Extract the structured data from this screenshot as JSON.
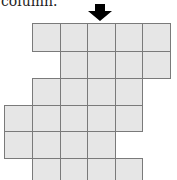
{
  "caption": {
    "text": "column."
  },
  "arrow": {
    "icon": "down-arrow-icon",
    "column": 4,
    "color": "#000000"
  },
  "grid": {
    "cell_fill": "#e6e6e6",
    "line_color": "#7a7a7a",
    "rows": [
      {
        "row": 1,
        "columns": [
          2,
          3,
          4,
          5,
          6
        ]
      },
      {
        "row": 2,
        "columns": [
          3,
          4,
          5,
          6
        ]
      },
      {
        "row": 3,
        "columns": [
          2,
          3,
          4,
          5
        ]
      },
      {
        "row": 4,
        "columns": [
          1,
          2,
          3,
          4,
          5
        ]
      },
      {
        "row": 5,
        "columns": [
          1,
          2,
          3,
          4
        ]
      },
      {
        "row": 6,
        "columns": [
          2,
          3,
          4,
          5
        ]
      }
    ]
  }
}
